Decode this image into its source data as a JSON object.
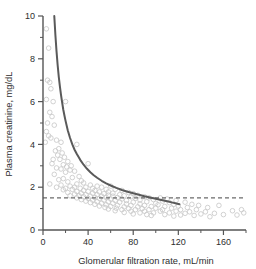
{
  "chart_data": {
    "type": "scatter",
    "title": "",
    "xlabel": "Glomerular filtration rate, mL/min",
    "ylabel": "Plasma creatinine, mg/dL",
    "xlim": [
      0,
      180
    ],
    "ylim": [
      0,
      10
    ],
    "xticks": [
      0,
      40,
      80,
      120,
      160
    ],
    "xtick_labels": [
      "0",
      "40",
      "80",
      "120",
      "160"
    ],
    "xminor_ticks": [
      20,
      60,
      100,
      140,
      180
    ],
    "yticks": [
      0,
      2,
      4,
      6,
      8,
      10
    ],
    "ytick_labels": [
      "0",
      "2",
      "4",
      "6",
      "8",
      "10"
    ],
    "yminor_ticks": [
      1,
      3,
      5,
      7,
      9
    ],
    "grid": false,
    "legend": "none",
    "series": [
      {
        "name": "Patient observations",
        "type": "scatter",
        "marker": "open-circle",
        "color": "#c9c9c9",
        "points": [
          [
            3,
            9.4
          ],
          [
            5,
            8.5
          ],
          [
            4,
            7.0
          ],
          [
            6,
            6.9
          ],
          [
            7,
            6.6
          ],
          [
            3,
            6.1
          ],
          [
            9,
            6.0
          ],
          [
            20,
            6.0
          ],
          [
            6,
            5.5
          ],
          [
            8,
            5.3
          ],
          [
            4,
            5.0
          ],
          [
            10,
            4.9
          ],
          [
            3,
            4.6
          ],
          [
            5,
            4.4
          ],
          [
            7,
            4.3
          ],
          [
            2,
            4.1
          ],
          [
            12,
            4.2
          ],
          [
            16,
            4.1
          ],
          [
            30,
            4.0
          ],
          [
            14,
            3.8
          ],
          [
            11,
            3.7
          ],
          [
            17,
            3.6
          ],
          [
            13,
            3.5
          ],
          [
            19,
            3.4
          ],
          [
            9,
            3.3
          ],
          [
            15,
            3.3
          ],
          [
            22,
            3.2
          ],
          [
            8,
            3.1
          ],
          [
            18,
            3.05
          ],
          [
            25,
            3.0
          ],
          [
            21,
            2.95
          ],
          [
            40,
            3.1
          ],
          [
            12,
            2.9
          ],
          [
            16,
            2.85
          ],
          [
            24,
            2.8
          ],
          [
            28,
            2.75
          ],
          [
            20,
            2.7
          ],
          [
            10,
            2.6
          ],
          [
            32,
            2.5
          ],
          [
            26,
            2.45
          ],
          [
            18,
            2.4
          ],
          [
            14,
            2.35
          ],
          [
            34,
            2.3
          ],
          [
            22,
            2.25
          ],
          [
            36,
            2.2
          ],
          [
            6,
            2.15
          ],
          [
            30,
            2.15
          ],
          [
            42,
            2.1
          ],
          [
            16,
            2.1
          ],
          [
            24,
            2.05
          ],
          [
            48,
            2.05
          ],
          [
            12,
            2.0
          ],
          [
            28,
            2.0
          ],
          [
            38,
            2.0
          ],
          [
            52,
            2.0
          ],
          [
            60,
            2.05
          ],
          [
            20,
            1.95
          ],
          [
            33,
            1.95
          ],
          [
            44,
            1.95
          ],
          [
            56,
            1.9
          ],
          [
            26,
            1.9
          ],
          [
            18,
            1.88
          ],
          [
            36,
            1.85
          ],
          [
            46,
            1.85
          ],
          [
            64,
            1.9
          ],
          [
            30,
            1.8
          ],
          [
            40,
            1.8
          ],
          [
            50,
            1.78
          ],
          [
            58,
            1.78
          ],
          [
            70,
            1.85
          ],
          [
            22,
            1.75
          ],
          [
            34,
            1.72
          ],
          [
            44,
            1.72
          ],
          [
            54,
            1.7
          ],
          [
            62,
            1.72
          ],
          [
            76,
            1.75
          ],
          [
            28,
            1.68
          ],
          [
            38,
            1.65
          ],
          [
            48,
            1.65
          ],
          [
            58,
            1.63
          ],
          [
            68,
            1.65
          ],
          [
            80,
            1.7
          ],
          [
            24,
            1.6
          ],
          [
            32,
            1.6
          ],
          [
            42,
            1.58
          ],
          [
            52,
            1.58
          ],
          [
            62,
            1.58
          ],
          [
            72,
            1.6
          ],
          [
            84,
            1.62
          ],
          [
            36,
            1.55
          ],
          [
            46,
            1.52
          ],
          [
            56,
            1.52
          ],
          [
            66,
            1.52
          ],
          [
            78,
            1.55
          ],
          [
            90,
            1.55
          ],
          [
            30,
            1.5
          ],
          [
            40,
            1.48
          ],
          [
            50,
            1.48
          ],
          [
            60,
            1.45
          ],
          [
            70,
            1.45
          ],
          [
            82,
            1.48
          ],
          [
            94,
            1.5
          ],
          [
            104,
            1.5
          ],
          [
            34,
            1.42
          ],
          [
            44,
            1.4
          ],
          [
            54,
            1.4
          ],
          [
            64,
            1.38
          ],
          [
            74,
            1.38
          ],
          [
            86,
            1.4
          ],
          [
            98,
            1.42
          ],
          [
            110,
            1.45
          ],
          [
            38,
            1.35
          ],
          [
            48,
            1.32
          ],
          [
            58,
            1.32
          ],
          [
            68,
            1.3
          ],
          [
            80,
            1.3
          ],
          [
            92,
            1.32
          ],
          [
            106,
            1.35
          ],
          [
            118,
            1.38
          ],
          [
            42,
            1.28
          ],
          [
            52,
            1.25
          ],
          [
            62,
            1.25
          ],
          [
            74,
            1.22
          ],
          [
            86,
            1.22
          ],
          [
            100,
            1.25
          ],
          [
            112,
            1.28
          ],
          [
            126,
            1.3
          ],
          [
            46,
            1.2
          ],
          [
            56,
            1.18
          ],
          [
            66,
            1.15
          ],
          [
            78,
            1.15
          ],
          [
            90,
            1.15
          ],
          [
            102,
            1.18
          ],
          [
            116,
            1.2
          ],
          [
            132,
            1.2
          ],
          [
            50,
            1.12
          ],
          [
            60,
            1.1
          ],
          [
            72,
            1.08
          ],
          [
            84,
            1.08
          ],
          [
            96,
            1.1
          ],
          [
            108,
            1.1
          ],
          [
            120,
            1.12
          ],
          [
            138,
            1.15
          ],
          [
            55,
            1.05
          ],
          [
            65,
            1.02
          ],
          [
            76,
            1.0
          ],
          [
            88,
            1.0
          ],
          [
            100,
            1.02
          ],
          [
            114,
            1.02
          ],
          [
            128,
            1.05
          ],
          [
            146,
            1.05
          ],
          [
            58,
            0.98
          ],
          [
            70,
            0.95
          ],
          [
            82,
            0.95
          ],
          [
            94,
            0.95
          ],
          [
            106,
            0.95
          ],
          [
            122,
            0.95
          ],
          [
            136,
            0.95
          ],
          [
            156,
            1.15
          ],
          [
            64,
            0.9
          ],
          [
            78,
            0.88
          ],
          [
            90,
            0.88
          ],
          [
            104,
            0.88
          ],
          [
            118,
            0.88
          ],
          [
            130,
            0.85
          ],
          [
            144,
            0.85
          ],
          [
            168,
            0.9
          ],
          [
            72,
            0.82
          ],
          [
            86,
            0.8
          ],
          [
            98,
            0.8
          ],
          [
            112,
            0.8
          ],
          [
            126,
            0.78
          ],
          [
            140,
            0.75
          ],
          [
            152,
            0.78
          ],
          [
            176,
            0.95
          ],
          [
            80,
            0.75
          ],
          [
            92,
            0.72
          ],
          [
            108,
            0.72
          ],
          [
            122,
            0.7
          ],
          [
            134,
            0.68
          ],
          [
            160,
            0.72
          ],
          [
            172,
            0.7
          ],
          [
            178,
            0.8
          ],
          [
            96,
            0.68
          ],
          [
            116,
            0.65
          ],
          [
            148,
            0.62
          ]
        ]
      }
    ],
    "curve": {
      "name": "Inverse relationship fit",
      "type": "line",
      "color": "#5a5a5a",
      "equation": "plasma creatinine inversely proportional to GFR",
      "x_start": 10,
      "x_end": 121,
      "points": [
        [
          10,
          10.0
        ],
        [
          11,
          9.1
        ],
        [
          12,
          8.35
        ],
        [
          13,
          7.7
        ],
        [
          14,
          7.15
        ],
        [
          15,
          6.7
        ],
        [
          16,
          6.3
        ],
        [
          17,
          5.95
        ],
        [
          18,
          5.62
        ],
        [
          19,
          5.35
        ],
        [
          20,
          5.1
        ],
        [
          22,
          4.65
        ],
        [
          24,
          4.3
        ],
        [
          26,
          4.0
        ],
        [
          28,
          3.75
        ],
        [
          30,
          3.55
        ],
        [
          33,
          3.28
        ],
        [
          36,
          3.05
        ],
        [
          39,
          2.86
        ],
        [
          42,
          2.7
        ],
        [
          45,
          2.56
        ],
        [
          48,
          2.44
        ],
        [
          52,
          2.3
        ],
        [
          56,
          2.18
        ],
        [
          60,
          2.08
        ],
        [
          65,
          1.97
        ],
        [
          70,
          1.87
        ],
        [
          75,
          1.79
        ],
        [
          80,
          1.72
        ],
        [
          85,
          1.65
        ],
        [
          90,
          1.58
        ],
        [
          95,
          1.52
        ],
        [
          100,
          1.46
        ],
        [
          105,
          1.4
        ],
        [
          110,
          1.34
        ],
        [
          115,
          1.28
        ],
        [
          121,
          1.2
        ]
      ]
    },
    "reference_line": {
      "name": "upper limit of normal plasma creatinine",
      "type": "hline",
      "style": "dashed",
      "color": "#6b6b6b",
      "y": 1.5,
      "x_start": 43,
      "x_end": 245
    }
  }
}
